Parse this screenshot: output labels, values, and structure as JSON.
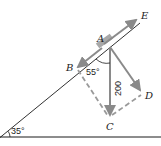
{
  "diagram": {
    "type": "force-vector-diagram",
    "colors": {
      "line": "#1a1a1a",
      "vector": "#8a8a8a",
      "dashed": "#9a9a9a",
      "block": "#a8a8a8",
      "text": "#222222"
    },
    "points": {
      "A": "A",
      "B": "B",
      "C": "C",
      "D": "D",
      "E": "E"
    },
    "angles": {
      "incline": "35°",
      "between_AB_and_AC": "55°"
    },
    "force_label": "200"
  }
}
